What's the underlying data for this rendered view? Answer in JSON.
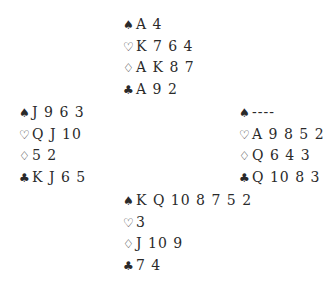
{
  "suits": {
    "spades": "♠",
    "hearts": "♡",
    "diamonds": "♢",
    "clubs": "♣"
  },
  "hands": {
    "north": {
      "spades": "A 4",
      "hearts": "K 7 6 4",
      "diamonds": "A K 8 7",
      "clubs": "A 9 2"
    },
    "west": {
      "spades": "J 9 6 3",
      "hearts": "Q J 10",
      "diamonds": "5 2",
      "clubs": "K J 6 5"
    },
    "east": {
      "spades": "----",
      "hearts": "A 9 8 5 2",
      "diamonds": "Q 6 4 3",
      "clubs": "Q 10 8 3"
    },
    "south": {
      "spades": "K Q 10 8 7 5 2",
      "hearts": "3",
      "diamonds": "J 10 9",
      "clubs": "7 4"
    }
  }
}
